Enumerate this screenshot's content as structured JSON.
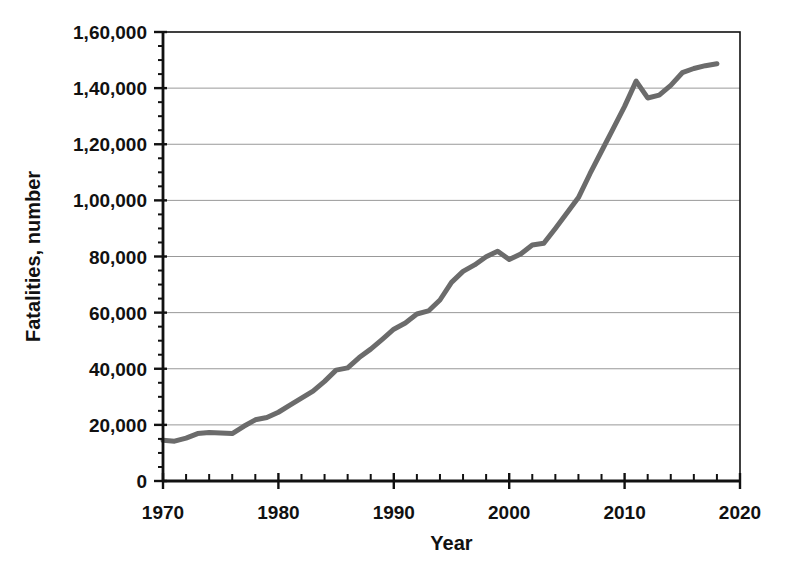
{
  "chart_data": {
    "type": "line",
    "title": "",
    "xlabel": "Year",
    "ylabel": "Fatalities, number",
    "xlim": [
      1970,
      2020
    ],
    "ylim": [
      0,
      160000
    ],
    "x_major_tick_step": 10,
    "x_minor_tick_step": 2,
    "y_major_tick_step": 20000,
    "y_minor_tick_step": 5000,
    "x_tick_labels": [
      "1970",
      "1980",
      "1990",
      "2000",
      "2010",
      "2020"
    ],
    "y_tick_labels": [
      "0",
      "20,000",
      "40,000",
      "60,000",
      "80,000",
      "1,00,000",
      "1,20,000",
      "1,40,000",
      "1,60,000"
    ],
    "grid": "horizontal-major",
    "legend": "none",
    "colors": {
      "line": "#6b6b6b",
      "gridline": "#999999",
      "axis": "#111111",
      "background": "#ffffff"
    },
    "series": [
      {
        "name": "Road fatalities per year",
        "x": [
          1970,
          1971,
          1972,
          1973,
          1974,
          1975,
          1976,
          1977,
          1978,
          1979,
          1980,
          1981,
          1982,
          1983,
          1984,
          1985,
          1986,
          1987,
          1988,
          1989,
          1990,
          1991,
          1992,
          1993,
          1994,
          1995,
          1996,
          1997,
          1998,
          1999,
          2000,
          2001,
          2002,
          2003,
          2004,
          2005,
          2006,
          2007,
          2008,
          2009,
          2010,
          2011,
          2012,
          2013,
          2014,
          2015,
          2016,
          2017,
          2018
        ],
        "values": [
          14500,
          14200,
          15300,
          16900,
          17300,
          17100,
          16900,
          19500,
          21800,
          22600,
          24500,
          27000,
          29500,
          32000,
          35500,
          39500,
          40300,
          44000,
          47000,
          50500,
          54100,
          56300,
          59500,
          60600,
          64500,
          70800,
          74700,
          77000,
          79900,
          81900,
          78900,
          80900,
          84100,
          84700,
          90000,
          95500,
          101000,
          109500,
          117500,
          125500,
          133500,
          142500,
          136500,
          137500,
          141000,
          145500,
          147000,
          148000,
          148700
        ]
      }
    ]
  }
}
